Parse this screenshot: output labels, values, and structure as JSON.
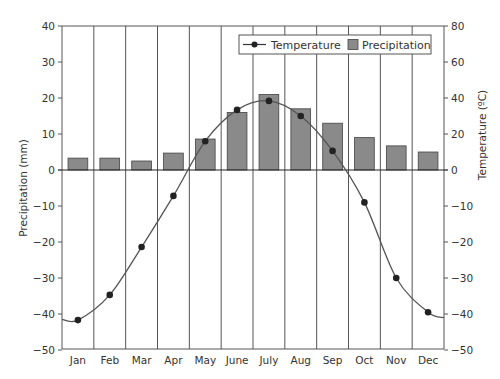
{
  "chart_data": {
    "type": "bar+line",
    "title": "",
    "categories": [
      "Jan",
      "Feb",
      "Mar",
      "Apr",
      "May",
      "June",
      "July",
      "Aug",
      "Sep",
      "Oct",
      "Nov",
      "Dec"
    ],
    "series": [
      {
        "name": "Precipitation",
        "type": "bar",
        "axis": "left",
        "values": [
          3.3,
          3.3,
          2.5,
          4.7,
          8.6,
          16,
          21,
          17,
          13,
          9,
          6.7,
          5
        ],
        "color": "#8a8a8a"
      },
      {
        "name": "Temperature",
        "type": "line",
        "axis": "left-pixel-space",
        "plotted_values_left_units": [
          -41.7,
          -34.7,
          -21.4,
          -7.2,
          8,
          16.7,
          19.2,
          15,
          5.3,
          -9,
          -30,
          -39.5
        ],
        "values_right_axis_labels": [
          -42,
          -35,
          -21,
          -7,
          16,
          33,
          38,
          30,
          11,
          -9,
          -30,
          -40
        ],
        "color": "#555555",
        "marker_color": "#222222"
      }
    ],
    "xlabel": "",
    "ylabel_left": "Precipitation (mm)",
    "ylabel_right": "Temperature (ºC)",
    "ylim_left": [
      -50,
      40
    ],
    "left_ticks": [
      40,
      30,
      20,
      10,
      0,
      -10,
      -20,
      -30,
      -40,
      -50
    ],
    "right_ticks": [
      80,
      60,
      40,
      20,
      0,
      -10,
      -20,
      -30,
      -40,
      -50
    ],
    "grid": "vertical lines between months",
    "legend": {
      "position": "top-right inside",
      "entries": [
        "Temperature",
        "Precipitation"
      ]
    }
  },
  "legend": {
    "temperature_label": "Temperature",
    "precipitation_label": "Precipitation"
  },
  "axes": {
    "left_title": "Precipitation (mm)",
    "right_title": "Temperature (ºC)"
  }
}
